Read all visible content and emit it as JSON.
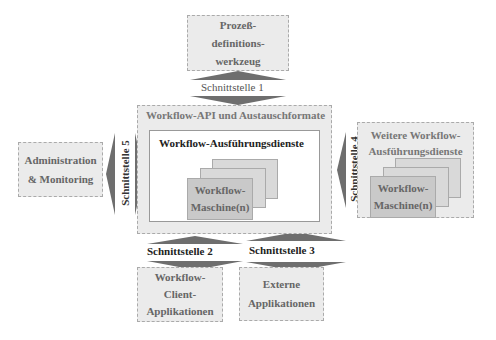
{
  "diagram": {
    "top_box": {
      "lines": [
        "Prozeß-",
        "definitions-",
        "werkzeug"
      ]
    },
    "left_box": {
      "lines": [
        "Administration",
        "& Monitoring"
      ]
    },
    "center": {
      "outer_title": "Workflow-API und Austauschformate",
      "inner_title": "Workflow-Ausführungsdienste",
      "machine_lines": [
        "Workflow-",
        "Maschine(n)"
      ]
    },
    "right_box": {
      "title_lines": [
        "Weitere Workflow-",
        "Ausführungsdienste"
      ],
      "machine_lines": [
        "Workflow-",
        "Maschine(n)"
      ]
    },
    "bottom_left_box": {
      "lines": [
        "Workflow-",
        "Client-",
        "Applikationen"
      ]
    },
    "bottom_right_box": {
      "lines": [
        "Externe",
        "Applikationen"
      ]
    },
    "interfaces": {
      "i1": "Schnittstelle 1",
      "i2": "Schnittstelle 2",
      "i3": "Schnittstelle 3",
      "i4": "Schnittstelle 4",
      "i5": "Schnittstelle 5"
    },
    "colors": {
      "box_fill": "#ebebeb",
      "machine_front": "#c9c9c9",
      "machine_back": "#d9d9d9",
      "arrow": "#6e6e6e"
    }
  }
}
